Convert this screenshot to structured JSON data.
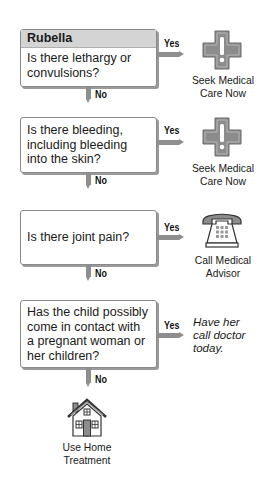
{
  "flowchart": {
    "title": "Rubella",
    "steps": [
      {
        "question": "Is there lethargy or convulsions?",
        "yes_label": "Yes",
        "no_label": "No",
        "yes_outcome": {
          "icon": "medical-cross-exclamation-icon",
          "line1": "Seek Medical",
          "line2": "Care Now"
        }
      },
      {
        "question": "Is there bleeding, including bleeding into the skin?",
        "yes_label": "Yes",
        "no_label": "No",
        "yes_outcome": {
          "icon": "medical-cross-exclamation-icon",
          "line1": "Seek Medical",
          "line2": "Care Now"
        }
      },
      {
        "question": "Is there joint pain?",
        "yes_label": "Yes",
        "no_label": "No",
        "yes_outcome": {
          "icon": "telephone-icon",
          "line1": "Call Medical",
          "line2": "Advisor"
        }
      },
      {
        "question": "Has the child possibly come in contact with a pregnant woman or her children?",
        "yes_label": "Yes",
        "no_label": "No",
        "yes_outcome": {
          "note_line1": "Have her",
          "note_line2": "call doctor",
          "note_line3": "today."
        }
      }
    ],
    "final_outcome": {
      "icon": "house-icon",
      "line1": "Use Home",
      "line2": "Treatment"
    }
  },
  "colors": {
    "arrow": "#8e8e8e",
    "header_bg": "#d4d4d4",
    "icon_fill": "#8c8c8c",
    "box_border": "#8a8a8a"
  }
}
